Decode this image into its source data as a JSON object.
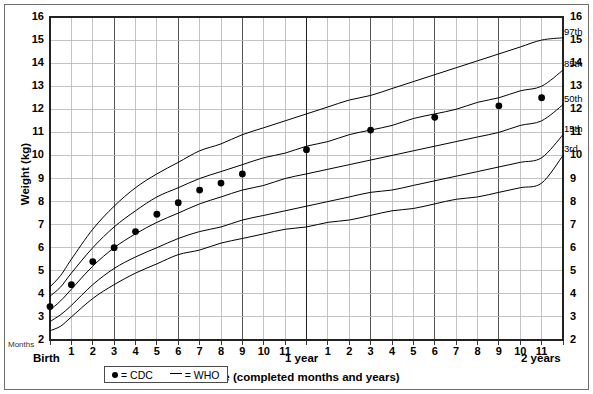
{
  "chart_data": {
    "type": "line",
    "title": "",
    "subtitle": "",
    "xlabel": "Age (completed months and years)",
    "ylabel": "Weight (kg)",
    "xlim": [
      0,
      24
    ],
    "ylim": [
      2,
      16
    ],
    "grid": true,
    "x_unit": "months",
    "x_tick_labels": [
      "1",
      "2",
      "3",
      "4",
      "5",
      "6",
      "7",
      "8",
      "9",
      "10",
      "11",
      "1",
      "2",
      "3",
      "4",
      "5",
      "6",
      "7",
      "8",
      "9",
      "10",
      "11"
    ],
    "x_major_labels": [
      {
        "label": "Birth",
        "months": 0
      },
      {
        "label": "1 year",
        "months": 12
      },
      {
        "label": "2 years",
        "months": 24
      }
    ],
    "y_tick_labels": [
      "2",
      "3",
      "4",
      "5",
      "6",
      "7",
      "8",
      "9",
      "10",
      "11",
      "12",
      "13",
      "14",
      "15",
      "16"
    ],
    "y_axis_left_label": "Months",
    "legend": {
      "position": "bottom-center",
      "entries": [
        {
          "symbol": "dot",
          "label": "= CDC"
        },
        {
          "symbol": "dash",
          "label": "= WHO"
        }
      ]
    },
    "series": [
      {
        "name": "3rd",
        "label": "3rd",
        "type": "who-percentile-curve",
        "x": [
          0,
          0.5,
          1,
          2,
          3,
          4,
          5,
          6,
          7,
          8,
          9,
          10,
          11,
          12,
          13,
          14,
          15,
          16,
          17,
          18,
          19,
          20,
          21,
          22,
          23,
          24
        ],
        "y": [
          2.4,
          2.6,
          3.0,
          3.8,
          4.4,
          4.9,
          5.3,
          5.7,
          5.9,
          6.2,
          6.4,
          6.6,
          6.8,
          6.9,
          7.1,
          7.2,
          7.4,
          7.6,
          7.7,
          7.9,
          8.1,
          8.2,
          8.4,
          8.6,
          8.8,
          10.0
        ]
      },
      {
        "name": "15th",
        "label": "15th",
        "type": "who-percentile-curve",
        "x": [
          0,
          0.5,
          1,
          2,
          3,
          4,
          5,
          6,
          7,
          8,
          9,
          10,
          11,
          12,
          13,
          14,
          15,
          16,
          17,
          18,
          19,
          20,
          21,
          22,
          23,
          24
        ],
        "y": [
          2.8,
          3.1,
          3.5,
          4.4,
          5.1,
          5.6,
          6.0,
          6.4,
          6.7,
          6.9,
          7.2,
          7.4,
          7.6,
          7.8,
          8.0,
          8.2,
          8.4,
          8.5,
          8.7,
          8.9,
          9.1,
          9.3,
          9.5,
          9.7,
          9.9,
          10.9
        ]
      },
      {
        "name": "50th",
        "label": "50th",
        "type": "who-percentile-curve",
        "x": [
          0,
          0.5,
          1,
          2,
          3,
          4,
          5,
          6,
          7,
          8,
          9,
          10,
          11,
          12,
          13,
          14,
          15,
          16,
          17,
          18,
          19,
          20,
          21,
          22,
          23,
          24
        ],
        "y": [
          3.3,
          3.7,
          4.2,
          5.2,
          6.0,
          6.6,
          7.1,
          7.5,
          7.9,
          8.2,
          8.5,
          8.7,
          9.0,
          9.2,
          9.4,
          9.6,
          9.8,
          10.0,
          10.2,
          10.4,
          10.6,
          10.8,
          11.0,
          11.3,
          11.5,
          12.2
        ]
      },
      {
        "name": "85th",
        "label": "85th",
        "type": "who-percentile-curve",
        "x": [
          0,
          0.5,
          1,
          2,
          3,
          4,
          5,
          6,
          7,
          8,
          9,
          10,
          11,
          12,
          13,
          14,
          15,
          16,
          17,
          18,
          19,
          20,
          21,
          22,
          23,
          24
        ],
        "y": [
          3.9,
          4.3,
          4.9,
          6.0,
          6.9,
          7.6,
          8.2,
          8.6,
          9.0,
          9.3,
          9.6,
          9.9,
          10.1,
          10.4,
          10.6,
          10.9,
          11.1,
          11.3,
          11.6,
          11.8,
          12.0,
          12.3,
          12.5,
          12.8,
          13.0,
          13.7
        ]
      },
      {
        "name": "97th",
        "label": "97th",
        "type": "who-percentile-curve",
        "x": [
          0,
          0.5,
          1,
          2,
          3,
          4,
          5,
          6,
          7,
          8,
          9,
          10,
          11,
          12,
          13,
          14,
          15,
          16,
          17,
          18,
          19,
          20,
          21,
          22,
          23,
          24
        ],
        "y": [
          4.3,
          4.8,
          5.5,
          6.8,
          7.8,
          8.6,
          9.2,
          9.7,
          10.2,
          10.5,
          10.9,
          11.2,
          11.5,
          11.8,
          12.1,
          12.4,
          12.6,
          12.9,
          13.2,
          13.5,
          13.8,
          14.1,
          14.4,
          14.7,
          15.0,
          15.1
        ]
      },
      {
        "name": "CDC",
        "label": "= CDC",
        "type": "scatter",
        "points": [
          {
            "x": 0,
            "y": 3.45
          },
          {
            "x": 1,
            "y": 4.4
          },
          {
            "x": 2,
            "y": 5.4
          },
          {
            "x": 3,
            "y": 6.0
          },
          {
            "x": 4,
            "y": 6.7
          },
          {
            "x": 5,
            "y": 7.45
          },
          {
            "x": 6,
            "y": 7.95
          },
          {
            "x": 7,
            "y": 8.5
          },
          {
            "x": 8,
            "y": 8.8
          },
          {
            "x": 9,
            "y": 9.2
          },
          {
            "x": 12,
            "y": 10.25
          },
          {
            "x": 15,
            "y": 11.1
          },
          {
            "x": 18,
            "y": 11.65
          },
          {
            "x": 21,
            "y": 12.15
          },
          {
            "x": 23,
            "y": 12.5
          }
        ]
      }
    ]
  },
  "colors": {
    "curve": "#000000",
    "marker": "#000000",
    "grid_minor": "#b8b8b8",
    "grid_major": "#555555",
    "axis": "#222222",
    "frame": "#6f6f6f",
    "background": "#ffffff"
  }
}
